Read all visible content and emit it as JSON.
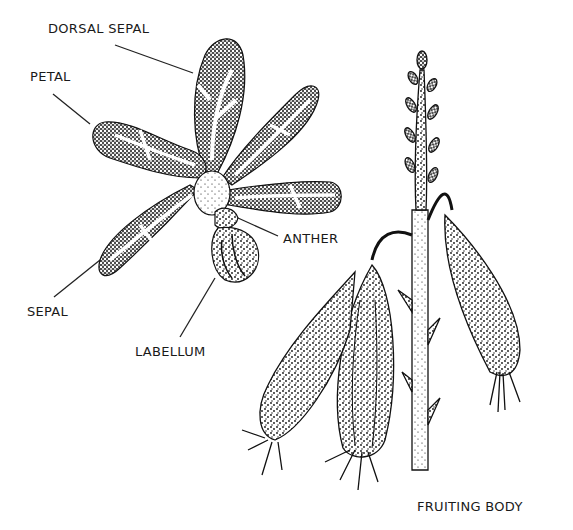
{
  "diagram": {
    "ink_color": "#111111",
    "background_color": "#ffffff",
    "labels": [
      {
        "id": "dorsal_sepal",
        "text": "DORSAL SEPAL",
        "x": 48,
        "y": 22
      },
      {
        "id": "petal",
        "text": "PETAL",
        "x": 30,
        "y": 70
      },
      {
        "id": "anther",
        "text": "ANTHER",
        "x": 283,
        "y": 232
      },
      {
        "id": "sepal",
        "text": "SEPAL",
        "x": 27,
        "y": 305
      },
      {
        "id": "labellum",
        "text": "LABELLUM",
        "x": 135,
        "y": 345
      },
      {
        "id": "fruiting_body",
        "text": "FRUITING BODY",
        "x": 417,
        "y": 500
      }
    ]
  }
}
